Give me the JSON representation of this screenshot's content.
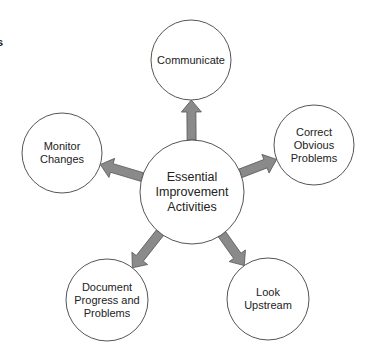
{
  "fragment_text": "s",
  "center": {
    "label": "Essential\nImprovement\nActivities",
    "cx": 192,
    "cy": 192,
    "r": 52
  },
  "nodes": [
    {
      "id": "communicate",
      "label": "Communicate",
      "cx": 191,
      "cy": 60,
      "r": 40
    },
    {
      "id": "correct",
      "label": "Correct\nObvious\nProblems",
      "cx": 314,
      "cy": 145,
      "r": 40
    },
    {
      "id": "look",
      "label": "Look\nUpstream",
      "cx": 268,
      "cy": 299,
      "r": 41
    },
    {
      "id": "document",
      "label": "Document\nProgress and\nProblems",
      "cx": 107,
      "cy": 300,
      "r": 41
    },
    {
      "id": "monitor",
      "label": "Monitor\nChanges",
      "cx": 62,
      "cy": 153,
      "r": 40
    }
  ],
  "colors": {
    "stroke": "#555555",
    "arrow_fill": "#8a8a8a",
    "arrow_stroke": "#555555",
    "text": "#222222"
  }
}
